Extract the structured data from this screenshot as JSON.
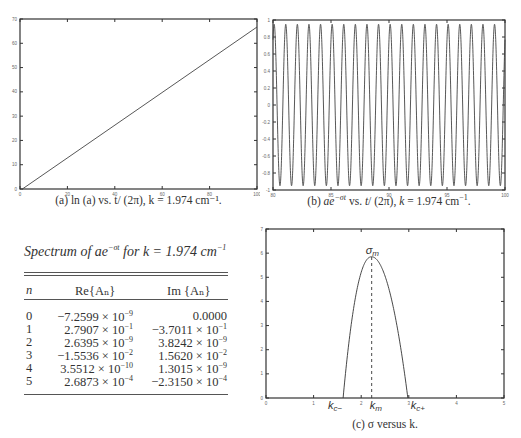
{
  "figure": {
    "caption_a": "(a) ln (a) vs. t/ (2π), k = 1.974 cm⁻¹.",
    "caption_b": "(b) ae⁻ᵠᵗ vs. t/ (2π), k = 1.974 cm⁻¹.",
    "caption_b_display": "(b) ae^{-σt} vs. t/ (2π), k = 1.974 cm⁻¹.",
    "caption_c": "(c) σ versus k."
  },
  "table": {
    "title": "Spectrum of ae^{-σt} for k = 1.974 cm^{-1}",
    "title_parts": {
      "a": "Spectrum of ae",
      "sup": "−σt",
      "b": " for k = 1.974 cm",
      "sup2": "−1"
    },
    "columns": [
      "n",
      "Re{Aₙ}",
      "Im {Aₙ}"
    ],
    "rows": [
      {
        "n": "0",
        "re": "−7.2599 × 10",
        "re_exp": "−9",
        "im": "0.0000",
        "im_exp": ""
      },
      {
        "n": "1",
        "re": "2.7907 × 10",
        "re_exp": "−1",
        "im": "−3.7011 × 10",
        "im_exp": "−1"
      },
      {
        "n": "2",
        "re": "2.6395 × 10",
        "re_exp": "−9",
        "im": "3.8242 × 10",
        "im_exp": "−9"
      },
      {
        "n": "3",
        "re": "−1.5536 × 10",
        "re_exp": "−2",
        "im": "1.5620 × 10",
        "im_exp": "−2"
      },
      {
        "n": "4",
        "re": "3.5512 × 10",
        "re_exp": "−10",
        "im": "1.3015 × 10",
        "im_exp": "−9"
      },
      {
        "n": "5",
        "re": "2.6873 × 10",
        "re_exp": "−4",
        "im": "−2.3150 × 10",
        "im_exp": "−4"
      }
    ]
  },
  "chart_data": [
    {
      "id": "a",
      "type": "line",
      "title": "(a) ln (a) vs. t/ (2π), k = 1.974 cm⁻¹.",
      "xlabel": "",
      "ylabel": "",
      "xlim": [
        0,
        100
      ],
      "ylim": [
        0,
        70
      ],
      "xticks": [
        0,
        20,
        40,
        60,
        80,
        100
      ],
      "yticks": [
        0,
        10,
        20,
        30,
        40,
        50,
        60,
        70
      ],
      "grid": false,
      "series": [
        {
          "name": "ln(a)",
          "x": [
            1,
            100
          ],
          "y": [
            0,
            66.7
          ]
        }
      ]
    },
    {
      "id": "b",
      "type": "line",
      "title": "(b) ae^{-σt} vs. t/ (2π), k = 1.974 cm⁻¹.",
      "xlim": [
        80,
        100
      ],
      "ylim": [
        -1,
        1
      ],
      "xticks": [
        80,
        85,
        90,
        95,
        100
      ],
      "yticks": [
        -1,
        -0.8,
        -0.6,
        -0.4,
        -0.2,
        0,
        0.2,
        0.4,
        0.6,
        0.8,
        1
      ],
      "grid": false,
      "series": [
        {
          "name": "ae^{-σt}",
          "function": "0.95*cos(2π(x-80.1))",
          "period": 1,
          "amplitude": 0.95
        }
      ]
    },
    {
      "id": "c",
      "type": "line",
      "title": "(c) σ versus k.",
      "xlim": [
        0,
        5
      ],
      "ylim": [
        0,
        7
      ],
      "xticks": [
        0,
        1,
        2,
        3,
        4,
        5
      ],
      "yticks": [
        0,
        1,
        2,
        3,
        4,
        5,
        6,
        7
      ],
      "grid": false,
      "annotations": [
        {
          "text": "σm",
          "x": 2.22,
          "y": 5.85
        },
        {
          "text": "kc−",
          "x": 1.62,
          "y": 0
        },
        {
          "text": "km",
          "x": 2.22,
          "y": 0
        },
        {
          "text": "kc+",
          "x": 2.98,
          "y": 0
        }
      ],
      "series": [
        {
          "name": "σ(k)",
          "x": [
            1.62,
            1.7,
            1.8,
            1.9,
            2.0,
            2.1,
            2.22,
            2.35,
            2.5,
            2.65,
            2.8,
            2.9,
            2.98
          ],
          "y": [
            0,
            2.3,
            3.7,
            4.7,
            5.3,
            5.7,
            5.85,
            5.7,
            5.1,
            4.0,
            2.5,
            1.3,
            0
          ]
        }
      ],
      "dashed_line": {
        "x": 2.22,
        "y_from": 0,
        "y_to": 5.85
      }
    }
  ]
}
